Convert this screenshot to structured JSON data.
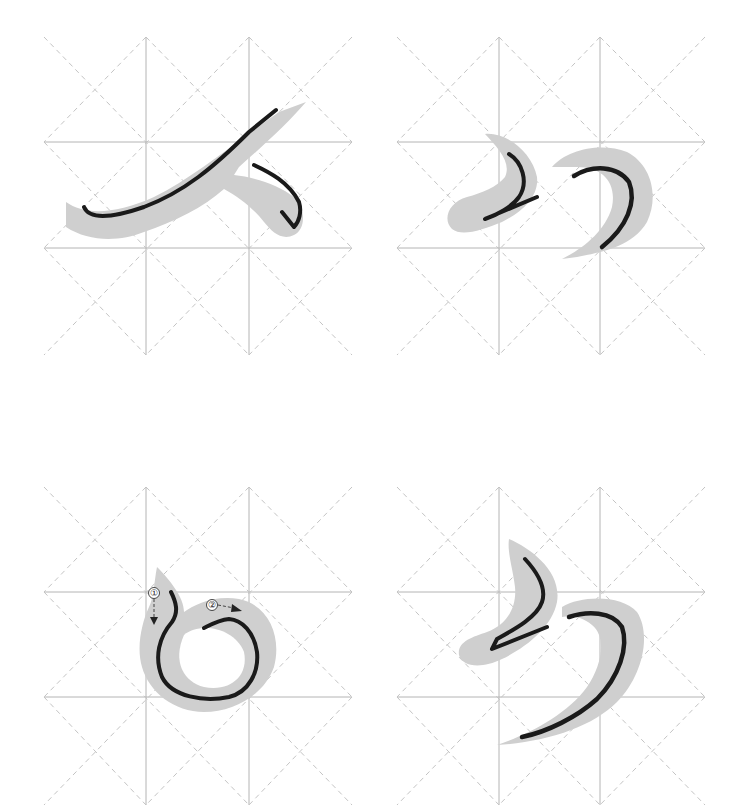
{
  "panels": [
    {
      "id": "panel-1",
      "character": "へ",
      "stroke_count": 1,
      "position": "top-left",
      "annotations": []
    },
    {
      "id": "panel-2",
      "character": "か",
      "stroke_count": 2,
      "position": "top-right",
      "annotations": []
    },
    {
      "id": "panel-3",
      "character": "の",
      "stroke_count": 2,
      "position": "bottom-left",
      "annotations": [
        {
          "label": "①",
          "direction": "down"
        },
        {
          "label": "②",
          "direction": "right"
        }
      ]
    },
    {
      "id": "panel-4",
      "character": "ろ",
      "stroke_count": 2,
      "position": "bottom-right",
      "annotations": []
    }
  ],
  "colors": {
    "ink": "#1a1a1a",
    "shadow": "#cfcfcf",
    "grid_solid": "#b4b4b4",
    "grid_dashed": "#c4c4c4",
    "background": "#ffffff"
  }
}
